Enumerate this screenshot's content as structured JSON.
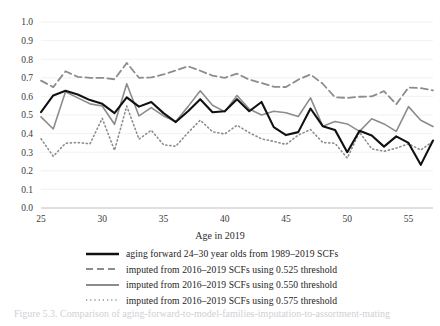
{
  "figure": {
    "caption_partial": "Figure 5.3. Comparison of aging-forward-to-model-families-imputation-to-assortment-mating"
  },
  "chart_data": {
    "type": "line",
    "title": "",
    "xlabel": "Age in 2019",
    "ylabel": "",
    "xlim": [
      25,
      57
    ],
    "ylim": [
      0.0,
      1.0
    ],
    "grid": true,
    "grid_axis": "y",
    "legend_position": "bottom",
    "xticks": [
      25,
      30,
      35,
      40,
      45,
      50,
      55
    ],
    "xtick_labels": [
      "25",
      "30",
      "35",
      "40",
      "45",
      "50",
      "55"
    ],
    "yticks": [
      0.0,
      0.1,
      0.2,
      0.3,
      0.4,
      0.5,
      0.6,
      0.7,
      0.8,
      0.9,
      1.0
    ],
    "ytick_labels": [
      "0.0",
      "0.1",
      "0.2",
      "0.3",
      "0.4",
      "0.5",
      "0.6",
      "0.7",
      "0.8",
      "0.9",
      "1.0"
    ],
    "x": [
      25,
      26,
      27,
      28,
      29,
      30,
      31,
      32,
      33,
      34,
      35,
      36,
      37,
      38,
      39,
      40,
      41,
      42,
      43,
      44,
      45,
      46,
      47,
      48,
      49,
      50,
      51,
      52,
      53,
      54,
      55,
      56,
      57
    ],
    "series": [
      {
        "name": "aging forward 24–30 year olds from 1989–2019 SCFs",
        "style": "solid",
        "color": "#111111",
        "width": 2.1,
        "values": [
          0.515,
          0.605,
          0.63,
          0.61,
          0.58,
          0.56,
          0.51,
          0.595,
          0.545,
          0.57,
          0.51,
          0.462,
          0.52,
          0.585,
          0.515,
          0.52,
          0.585,
          0.52,
          0.57,
          0.435,
          0.392,
          0.408,
          0.535,
          0.44,
          0.42,
          0.3,
          0.415,
          0.39,
          0.33,
          0.385,
          0.35,
          0.232,
          0.363
        ]
      },
      {
        "name": "imputed from 2016–2019 SCFs using 0.525 threshold",
        "style": "dashed",
        "color": "#8c8c8c",
        "width": 1.8,
        "values": [
          0.685,
          0.65,
          0.735,
          0.705,
          0.7,
          0.7,
          0.692,
          0.78,
          0.7,
          0.702,
          0.718,
          0.74,
          0.762,
          0.738,
          0.712,
          0.7,
          0.722,
          0.69,
          0.672,
          0.652,
          0.65,
          0.69,
          0.718,
          0.668,
          0.595,
          0.592,
          0.598,
          0.6,
          0.628,
          0.558,
          0.648,
          0.645,
          0.632
        ]
      },
      {
        "name": "imputed from 2016–2019 SCFs using 0.550 threshold",
        "style": "solid",
        "color": "#8c8c8c",
        "width": 1.6,
        "values": [
          0.49,
          0.425,
          0.625,
          0.592,
          0.56,
          0.548,
          0.45,
          0.668,
          0.495,
          0.54,
          0.495,
          0.465,
          0.545,
          0.63,
          0.552,
          0.518,
          0.605,
          0.532,
          0.5,
          0.52,
          0.512,
          0.492,
          0.592,
          0.44,
          0.465,
          0.452,
          0.412,
          0.48,
          0.452,
          0.412,
          0.545,
          0.472,
          0.438
        ]
      },
      {
        "name": "imputed from 2016–2019 SCFs using 0.575 threshold",
        "style": "dotted",
        "color": "#8c8c8c",
        "width": 1.6,
        "values": [
          0.372,
          0.278,
          0.348,
          0.352,
          0.345,
          0.482,
          0.31,
          0.548,
          0.37,
          0.418,
          0.34,
          0.332,
          0.405,
          0.472,
          0.41,
          0.398,
          0.445,
          0.405,
          0.372,
          0.358,
          0.342,
          0.392,
          0.422,
          0.352,
          0.348,
          0.268,
          0.408,
          0.318,
          0.305,
          0.322,
          0.345,
          0.312,
          0.358
        ]
      }
    ]
  }
}
